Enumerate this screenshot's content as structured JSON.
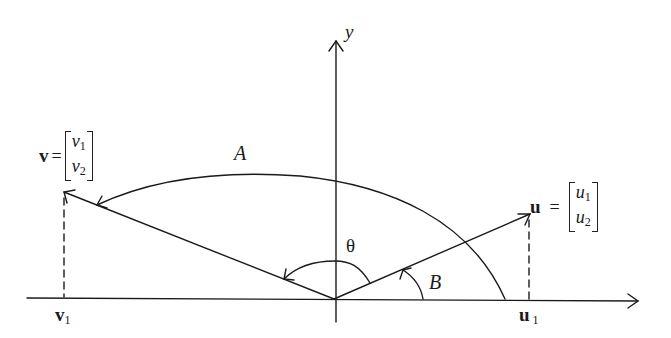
{
  "figure": {
    "axis_labels": {
      "y": "y"
    },
    "vectors": {
      "v": {
        "name": "v",
        "components": [
          "v",
          "v"
        ],
        "subscripts": [
          "1",
          "2"
        ],
        "projection_label": "v",
        "projection_sub": "1"
      },
      "u": {
        "name": "u",
        "components": [
          "u",
          "u"
        ],
        "subscripts": [
          "1",
          "2"
        ],
        "projection_label": "u",
        "projection_sub": "1"
      }
    },
    "equals": "=",
    "arc_labels": {
      "A": "A",
      "B": "B",
      "theta": "θ"
    },
    "geometry": {
      "origin": [
        334,
        299
      ],
      "x_axis": {
        "from": [
          27,
          298
        ],
        "to": [
          638,
          301
        ]
      },
      "y_axis": {
        "from": [
          336,
          322
        ],
        "to": [
          336,
          41
        ]
      },
      "v_tip": [
        64,
        192
      ],
      "u_tip": [
        530,
        214
      ],
      "line_color": "#1a1a1a"
    }
  }
}
